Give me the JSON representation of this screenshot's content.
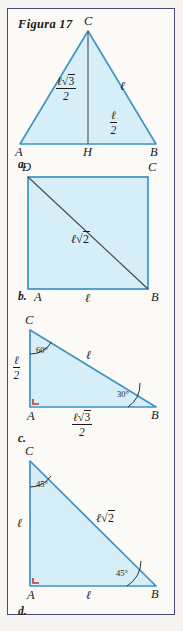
{
  "page": {
    "title": "Figura 17",
    "background_color": "#f6f5f1",
    "frame_border_color": "#4a4a7a",
    "shape_fill_color": "#d6eef8",
    "shape_stroke_color": "#3d92c6",
    "diagonal_stroke_color": "#4b4b4b",
    "right_angle_mark_color": "#c0392b",
    "text_color": "#1a1a1a"
  },
  "figures": [
    {
      "tag": "a.",
      "type": "equilateral-triangle-with-height",
      "vertices": {
        "apex": "C",
        "left": "A",
        "right": "B",
        "foot": "H"
      },
      "labels": {
        "height": {
          "numerator_coeff": "ℓ",
          "numerator_radical": "√3",
          "denominator": "2"
        },
        "slant_side": "ℓ",
        "half_base": {
          "numerator": "ℓ",
          "denominator": "2"
        }
      }
    },
    {
      "tag": "b.",
      "type": "square-with-diagonal",
      "vertices": {
        "top_left": "D",
        "top_right": "C",
        "bottom_left": "A",
        "bottom_right": "B"
      },
      "labels": {
        "diagonal": {
          "coeff": "ℓ",
          "radical": "√2"
        },
        "base": "ℓ"
      }
    },
    {
      "tag": "c.",
      "type": "right-triangle-30-60-90",
      "vertices": {
        "top": "C",
        "right_angle": "A",
        "right": "B"
      },
      "angles": {
        "at_C": "60°",
        "at_B": "30°",
        "at_A": "right-angle-mark"
      },
      "labels": {
        "vertical_leg": {
          "numerator": "ℓ",
          "denominator": "2"
        },
        "hypotenuse": "ℓ",
        "horizontal_leg": {
          "numerator_coeff": "ℓ",
          "numerator_radical": "√3",
          "denominator": "2"
        }
      }
    },
    {
      "tag": "d.",
      "type": "right-triangle-45-45-90",
      "vertices": {
        "top": "C",
        "right_angle": "A",
        "right": "B"
      },
      "angles": {
        "at_C": "45°",
        "at_B": "45°",
        "at_A": "right-angle-mark"
      },
      "labels": {
        "vertical_leg": "ℓ",
        "hypotenuse": {
          "coeff": "ℓ",
          "radical": "√2"
        },
        "horizontal_leg": "ℓ"
      }
    }
  ],
  "glyphs": {
    "ell": "ℓ",
    "sqrt2": "2",
    "sqrt3": "3",
    "two": "2",
    "radical_sign": "√"
  }
}
